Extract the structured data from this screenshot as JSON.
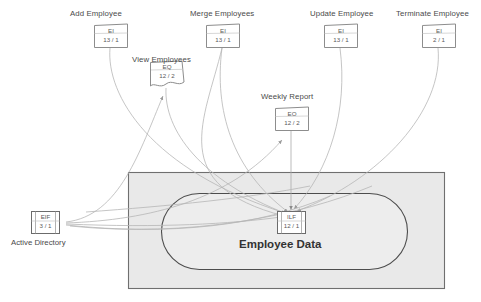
{
  "diagram": {
    "boundary": {
      "name": "application-boundary",
      "fill": "#e8e8e8",
      "stroke": "#6b6b6b"
    },
    "internal_store": {
      "label": "Employee Data",
      "type": "ILF",
      "counts": "12 / 1"
    },
    "external_store": {
      "label": "Active Directory",
      "type": "EIF",
      "counts": "3 / 1"
    },
    "transactions": [
      {
        "label": "Add Employee",
        "type": "EI",
        "counts": "13 / 1",
        "shape": "trapezoid"
      },
      {
        "label": "View Employees",
        "type": "EQ",
        "counts": "12 / 2",
        "shape": "document"
      },
      {
        "label": "Merge Employees",
        "type": "EI",
        "counts": "13 / 1",
        "shape": "trapezoid"
      },
      {
        "label": "Weekly Report",
        "type": "EO",
        "counts": "12 / 2",
        "shape": "trapezoid"
      },
      {
        "label": "Update Employee",
        "type": "EI",
        "counts": "13 / 1",
        "shape": "trapezoid"
      },
      {
        "label": "Terminate Employee",
        "type": "EI",
        "counts": "2 / 1",
        "shape": "trapezoid"
      }
    ]
  }
}
